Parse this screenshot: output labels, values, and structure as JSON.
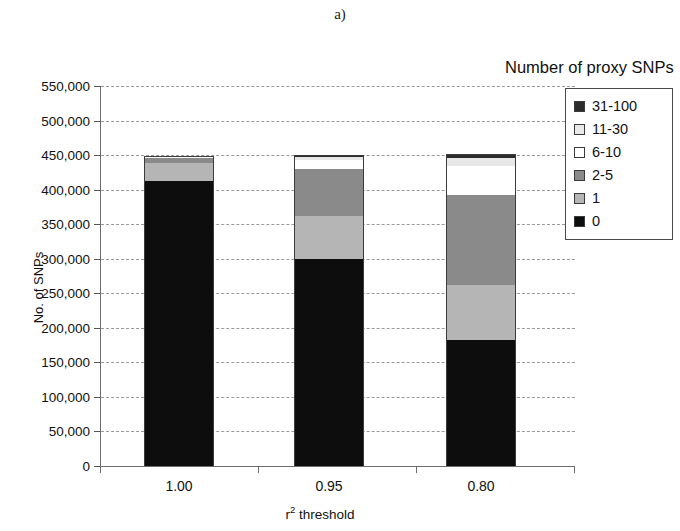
{
  "panel": {
    "label": "a)"
  },
  "legend": {
    "title": "Number of proxy SNPs",
    "entries": [
      {
        "label": "31-100",
        "color": "#2b2b2b",
        "swatch_name": "legend-swatch-31-100"
      },
      {
        "label": "11-30",
        "color": "#e8e8e8",
        "swatch_name": "legend-swatch-11-30"
      },
      {
        "label": "6-10",
        "color": "#ffffff",
        "swatch_name": "legend-swatch-6-10"
      },
      {
        "label": "2-5",
        "color": "#8a8a8a",
        "swatch_name": "legend-swatch-2-5"
      },
      {
        "label": "1",
        "color": "#b5b5b5",
        "swatch_name": "legend-swatch-1"
      },
      {
        "label": "0",
        "color": "#0d0d0d",
        "swatch_name": "legend-swatch-0"
      }
    ]
  },
  "axes": {
    "y_title": "No. of SNPs",
    "x_title_main": "r",
    "x_title_sup": "2",
    "x_title_rest": " threshold",
    "y_ticks": [
      "0",
      "50,000",
      "100,000",
      "150,000",
      "200,000",
      "250,000",
      "300,000",
      "350,000",
      "400,000",
      "450,000",
      "500,000",
      "550,000"
    ],
    "x_ticks": [
      "1.00",
      "0.95",
      "0.80"
    ]
  },
  "chart_data": {
    "type": "bar",
    "subtype": "stacked",
    "title": "a)",
    "xlabel": "r2 threshold",
    "ylabel": "No. of SNPs",
    "ylim": [
      0,
      550000
    ],
    "ytick_step": 50000,
    "grid": true,
    "legend_title": "Number of proxy SNPs",
    "legend_position": "right",
    "categories": [
      "1.00",
      "0.95",
      "0.80"
    ],
    "stack_order_bottom_to_top": [
      "0",
      "1",
      "2-5",
      "6-10",
      "11-30",
      "31-100"
    ],
    "series": [
      {
        "name": "0",
        "color": "#0d0d0d",
        "values": [
          412000,
          300000,
          183000
        ]
      },
      {
        "name": "1",
        "color": "#b5b5b5",
        "values": [
          26000,
          62000,
          79000
        ]
      },
      {
        "name": "2-5",
        "color": "#8a8a8a",
        "values": [
          8000,
          68000,
          130000
        ]
      },
      {
        "name": "6-10",
        "color": "#ffffff",
        "values": [
          1000,
          13000,
          42000
        ]
      },
      {
        "name": "11-30",
        "color": "#e8e8e8",
        "values": [
          1000,
          4000,
          12000
        ]
      },
      {
        "name": "31-100",
        "color": "#2b2b2b",
        "values": [
          1000,
          3000,
          5000
        ]
      }
    ],
    "totals": [
      449000,
      450000,
      451000
    ]
  }
}
